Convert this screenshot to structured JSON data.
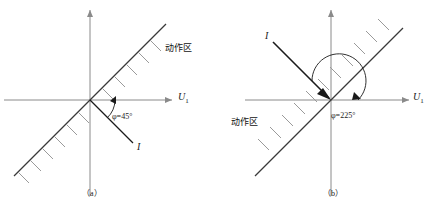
{
  "figure": {
    "type": "phase-comparison-diagram",
    "panels": [
      {
        "caption": "（a）",
        "axis_x_label_main": "U",
        "axis_x_label_sub": "1",
        "current_label": "I",
        "angle_label": "φ=45°",
        "zone_label": "动作区",
        "angle_degrees": 45,
        "zone_position": "upper-right",
        "current_direction": "down-right",
        "hatch_side": "lower-right"
      },
      {
        "caption": "（b）",
        "axis_x_label_main": "U",
        "axis_x_label_sub": "1",
        "current_label": "I",
        "angle_label": "φ=225°",
        "zone_label": "动作区",
        "angle_degrees": 225,
        "zone_position": "lower-left",
        "current_direction": "up-left",
        "hatch_side": "upper-left"
      }
    ]
  },
  "colors": {
    "axis": "#8a8a8a",
    "boundary": "#3a3a3a",
    "hatch": "#9a9a9a",
    "vector": "#1a1a1a",
    "text": "#1a1a1a"
  }
}
